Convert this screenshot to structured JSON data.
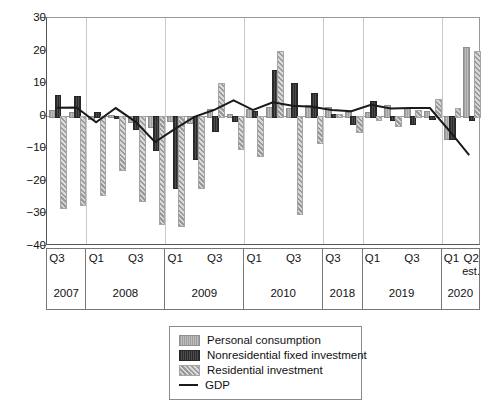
{
  "chart_data": {
    "type": "bar",
    "title": "",
    "subtitle": "",
    "xlabel": "",
    "ylabel": "",
    "ylim": [
      -40,
      30
    ],
    "yticks": [
      30,
      20,
      10,
      0,
      -10,
      -20,
      -30,
      -40
    ],
    "grid": false,
    "legend_position": "bottom-center",
    "axis_break_after": "2010 Q4",
    "x_groups": [
      {
        "year": "2007",
        "quarters": [
          "Q3",
          "Q4"
        ],
        "tick_labels": [
          "Q3",
          ""
        ]
      },
      {
        "year": "2008",
        "quarters": [
          "Q1",
          "Q2",
          "Q3",
          "Q4"
        ],
        "tick_labels": [
          "Q1",
          "",
          "Q3",
          ""
        ]
      },
      {
        "year": "2009",
        "quarters": [
          "Q1",
          "Q2",
          "Q3",
          "Q4"
        ],
        "tick_labels": [
          "Q1",
          "",
          "Q3",
          ""
        ]
      },
      {
        "year": "2010",
        "quarters": [
          "Q1",
          "Q2",
          "Q3",
          "Q4"
        ],
        "tick_labels": [
          "Q1",
          "",
          "Q3",
          ""
        ]
      },
      {
        "year": "2018",
        "quarters": [
          "Q3",
          "Q4"
        ],
        "tick_labels": [
          "Q3",
          ""
        ]
      },
      {
        "year": "2019",
        "quarters": [
          "Q1",
          "Q2",
          "Q3",
          "Q4"
        ],
        "tick_labels": [
          "Q1",
          "",
          "Q3",
          ""
        ]
      },
      {
        "year": "2020",
        "quarters": [
          "Q1",
          "Q2"
        ],
        "tick_labels": [
          "Q1",
          "Q2"
        ],
        "tick_sublabels": [
          "",
          "est."
        ]
      }
    ],
    "categories": [
      "2007 Q3",
      "2007 Q4",
      "2008 Q1",
      "2008 Q2",
      "2008 Q3",
      "2008 Q4",
      "2009 Q1",
      "2009 Q2",
      "2009 Q3",
      "2009 Q4",
      "2010 Q1",
      "2010 Q2",
      "2010 Q3",
      "2010 Q4",
      "2018 Q3",
      "2018 Q4",
      "2019 Q1",
      "2019 Q2",
      "2019 Q3",
      "2019 Q4",
      "2020 Q1",
      "2020 Q2 est."
    ],
    "series": [
      {
        "name": "Personal consumption",
        "key": "pc",
        "color": "#a8a8a8",
        "values": [
          1.8,
          1.2,
          -0.6,
          0.3,
          -1.6,
          -3.3,
          -1.4,
          -1.8,
          2.2,
          0.4,
          2.0,
          2.8,
          2.5,
          3.4,
          2.6,
          1.0,
          1.1,
          3.4,
          2.4,
          1.6,
          -6.8,
          21.0
        ]
      },
      {
        "name": "Nonresidential fixed investment",
        "key": "nri",
        "color": "#3a3a3a",
        "values": [
          6.3,
          6.0,
          1.1,
          -0.3,
          -3.7,
          -10.1,
          -22.0,
          -13.0,
          -4.3,
          -1.4,
          1.6,
          14.0,
          10.0,
          7.0,
          0.6,
          -2.3,
          4.4,
          -1.0,
          -2.3,
          -0.6,
          -6.7,
          -1.0
        ]
      },
      {
        "name": "Residential investment",
        "key": "ri",
        "color": "#b9b9b9",
        "values": [
          -28.0,
          -27.0,
          -24.0,
          -16.5,
          -26.0,
          -33.0,
          -33.5,
          -22.0,
          10.0,
          -10.0,
          -12.0,
          20.0,
          -30.0,
          -8.0,
          0.5,
          -4.6,
          -1.0,
          -3.0,
          1.8,
          5.0,
          2.5,
          19.8
        ]
      }
    ],
    "line_series": {
      "name": "GDP",
      "color": "#1a1a1a",
      "values": [
        2.2,
        2.3,
        -2.3,
        2.1,
        -2.1,
        -8.4,
        -4.4,
        -0.6,
        1.5,
        4.5,
        1.5,
        3.9,
        2.8,
        2.5,
        1.5,
        1.1,
        3.1,
        2.0,
        2.1,
        2.1,
        -5.0,
        -12.5
      ]
    },
    "legend": [
      {
        "label": "Personal consumption",
        "swatch": "pc"
      },
      {
        "label": "Nonresidential fixed investment",
        "swatch": "nri"
      },
      {
        "label": "Residential investment",
        "swatch": "ri"
      },
      {
        "label": "GDP",
        "swatch": "line"
      }
    ]
  }
}
